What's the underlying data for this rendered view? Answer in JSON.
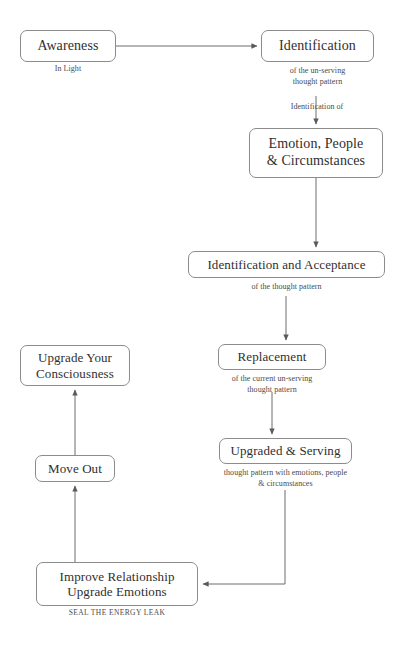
{
  "diagram": {
    "stroke_color": "#6d6d6d",
    "box_border_color": "#8c8c8c",
    "text_color": "#2f2f2f",
    "caption_color": "#4a4a4a",
    "background": "#ffffff"
  },
  "nodes": [
    {
      "id": "awareness",
      "label": "Awareness",
      "caption": "In Light",
      "font_size": 14,
      "x": 20,
      "y": 30,
      "w": 96,
      "h": 32,
      "caption_x": 20,
      "caption_y": 64,
      "caption_w": 96
    },
    {
      "id": "identification",
      "label": "Identification",
      "caption": "of the un-serving\nthought pattern",
      "font_size": 14,
      "x": 261,
      "y": 30,
      "w": 113,
      "h": 32,
      "caption_x": 261,
      "caption_y": 66,
      "caption_w": 113
    },
    {
      "id": "emotion-people-circumstances",
      "label": "Emotion, People\n& Circumstances",
      "caption": "",
      "font_size": 14,
      "x": 249,
      "y": 128,
      "w": 134,
      "h": 50,
      "caption_x": 0,
      "caption_y": 0,
      "caption_w": 0
    },
    {
      "id": "identification-and-acceptance",
      "label": "Identification and Acceptance",
      "caption": "of the thought pattern",
      "font_size": 13,
      "x": 188,
      "y": 251,
      "w": 197,
      "h": 27,
      "caption_x": 188,
      "caption_y": 282,
      "caption_w": 197
    },
    {
      "id": "replacement",
      "label": "Replacement",
      "caption": "of the current un-serving\nthought pattern",
      "font_size": 13,
      "x": 218,
      "y": 344,
      "w": 108,
      "h": 26,
      "caption_x": 180,
      "caption_y": 374,
      "caption_w": 184
    },
    {
      "id": "upgraded-and-serving",
      "label": "Upgraded & Serving",
      "caption": "thought pattern with emotions, people\n& circumstances",
      "font_size": 13,
      "x": 219,
      "y": 438,
      "w": 133,
      "h": 26,
      "caption_x": 180,
      "caption_y": 468,
      "caption_w": 211
    },
    {
      "id": "improve-relationship-upgrade-emotions",
      "label": "Improve Relationship\nUpgrade Emotions",
      "caption": "SEAL THE ENERGY LEAK",
      "font_size": 13,
      "x": 36,
      "y": 562,
      "w": 162,
      "h": 44,
      "caption_x": 36,
      "caption_y": 608,
      "caption_w": 162,
      "caption_style": "small-caps"
    },
    {
      "id": "move-out",
      "label": "Move Out",
      "caption": "",
      "font_size": 13,
      "x": 35,
      "y": 455,
      "w": 80,
      "h": 27,
      "caption_x": 0,
      "caption_y": 0,
      "caption_w": 0
    },
    {
      "id": "upgrade-your-consciousness",
      "label": "Upgrade Your\nConsciousness",
      "caption": "",
      "font_size": 13,
      "x": 20,
      "y": 345,
      "w": 110,
      "h": 41,
      "caption_x": 0,
      "caption_y": 0,
      "caption_w": 0
    }
  ],
  "edges": [
    {
      "id": "awareness-to-identification",
      "from": "awareness",
      "to": "identification",
      "path": "M116,46 L257,46",
      "arrow": true
    },
    {
      "id": "identification-to-emotion",
      "from": "identification",
      "to": "emotion-people-circumstances",
      "path": "M316,96 L316,124",
      "arrow": true,
      "mid_label": "Identification of",
      "label_x": 262,
      "label_y": 102,
      "label_w": 110
    },
    {
      "id": "emotion-to-acceptance",
      "from": "emotion-people-circumstances",
      "to": "identification-and-acceptance",
      "path": "M316,178 L316,247",
      "arrow": true
    },
    {
      "id": "acceptance-to-replacement",
      "from": "identification-and-acceptance",
      "to": "replacement",
      "path": "M286,296 L286,340",
      "arrow": true
    },
    {
      "id": "replacement-to-upgraded",
      "from": "replacement",
      "to": "upgraded-and-serving",
      "path": "M272,392 L272,434",
      "arrow": true
    },
    {
      "id": "upgraded-to-improve",
      "from": "upgraded-and-serving",
      "to": "improve-relationship-upgrade-emotions",
      "path": "M285,490 L285,584 L203,584",
      "arrow": true
    },
    {
      "id": "improve-to-move-out",
      "from": "improve-relationship-upgrade-emotions",
      "to": "move-out",
      "path": "M75,562 L75,486",
      "arrow": true
    },
    {
      "id": "move-out-to-upgrade-consciousness",
      "from": "move-out",
      "to": "upgrade-your-consciousness",
      "path": "M75,455 L75,390",
      "arrow": true
    }
  ],
  "edge_labels": [
    {
      "id": "identification-of-label",
      "text": "Identification of"
    }
  ]
}
